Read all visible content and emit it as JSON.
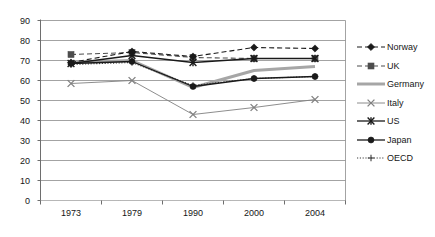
{
  "chart_data": {
    "type": "line",
    "title": "",
    "xlabel": "",
    "ylabel": "",
    "categories": [
      "1973",
      "1979",
      "1990",
      "2000",
      "2004"
    ],
    "ylim": [
      0,
      90
    ],
    "ytick_step": 10,
    "yticks": [
      "90",
      "80",
      "70",
      "60",
      "50",
      "40",
      "30",
      "20",
      "10",
      "0"
    ],
    "grid": true,
    "legend_position": "right",
    "series": [
      {
        "name": "Norway",
        "values": [
          69,
          74.5,
          72,
          76.5,
          76
        ],
        "color": "#1a1a1a",
        "line_style": "dashed",
        "marker": "diamond"
      },
      {
        "name": "UK",
        "values": [
          73,
          74,
          71.5,
          71,
          71
        ],
        "color": "#4d4d4d",
        "line_style": "dashed",
        "marker": "square"
      },
      {
        "name": "Germany",
        "values": [
          69,
          70,
          56.5,
          65,
          67
        ],
        "color": "#a6a6a6",
        "line_style": "solid-thick",
        "marker": "none"
      },
      {
        "name": "Italy",
        "values": [
          58.5,
          60,
          43,
          46.5,
          50.5
        ],
        "color": "#808080",
        "line_style": "solid-thin",
        "marker": "x"
      },
      {
        "name": "US",
        "values": [
          68.5,
          72.5,
          69,
          71,
          71
        ],
        "color": "#1a1a1a",
        "line_style": "solid",
        "marker": "asterisk"
      },
      {
        "name": "Japan",
        "values": [
          68.5,
          69.5,
          57,
          61,
          62
        ],
        "color": "#1a1a1a",
        "line_style": "solid",
        "marker": "circle"
      },
      {
        "name": "OECD",
        "values": [
          68,
          69,
          57.5,
          61,
          62
        ],
        "color": "#3d3d3d",
        "line_style": "dotted",
        "marker": "plus"
      }
    ]
  },
  "legend": {
    "items": [
      {
        "label": "Norway"
      },
      {
        "label": "UK"
      },
      {
        "label": "Germany"
      },
      {
        "label": "Italy"
      },
      {
        "label": "US"
      },
      {
        "label": "Japan"
      },
      {
        "label": "OECD"
      }
    ]
  },
  "axes": {
    "y_labels": [
      "90",
      "80",
      "70",
      "60",
      "50",
      "40",
      "30",
      "20",
      "10",
      "0"
    ],
    "x_labels": [
      "1973",
      "1979",
      "1990",
      "2000",
      "2004"
    ]
  },
  "colors": {
    "grid": "#8c8c8c",
    "axis": "#6e6e6e",
    "text": "#161616",
    "norway": "#1a1a1a",
    "uk": "#4d4d4d",
    "germany": "#a6a6a6",
    "italy": "#808080",
    "us": "#1a1a1a",
    "japan": "#1a1a1a",
    "oecd": "#3d3d3d"
  }
}
